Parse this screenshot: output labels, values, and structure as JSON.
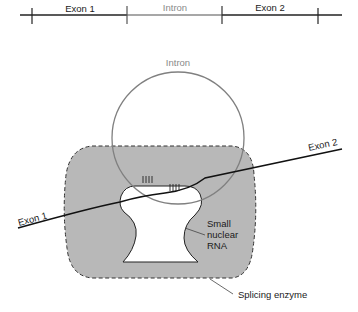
{
  "gene_bar": {
    "segments": [
      {
        "label": "Exon 1",
        "color": "#1a1a1a"
      },
      {
        "label": "Intron",
        "color": "#8a8a8a"
      },
      {
        "label": "Exon 2",
        "color": "#1a1a1a"
      }
    ]
  },
  "spliceosome": {
    "intron_label": "Intron",
    "exon1_label": "Exon 1",
    "exon2_label": "Exon 2",
    "snrna_label_lines": [
      "Small",
      "nuclear",
      "RNA"
    ],
    "enzyme_label": "Splicing enzyme",
    "colors": {
      "enzyme_fill": "#b8b8b8",
      "intron_stroke": "#808080",
      "rna_stroke": "#111111"
    }
  }
}
